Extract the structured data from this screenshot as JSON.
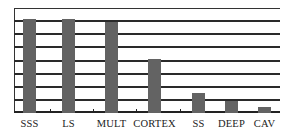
{
  "chart_data": {
    "type": "bar",
    "title": "",
    "xlabel": "",
    "ylabel": "",
    "categories": [
      "SSS",
      "LS",
      "MULT",
      "CORTEX",
      "SS",
      "DEEP",
      "CAV"
    ],
    "values": [
      7.2,
      7.2,
      6.9,
      4.1,
      1.5,
      0.9,
      0.45
    ],
    "ylim": [
      0,
      8
    ],
    "y_tick_labels_shown": false,
    "grid": true,
    "gridline_count": 8,
    "legend": null,
    "bar_color": "#636363"
  }
}
